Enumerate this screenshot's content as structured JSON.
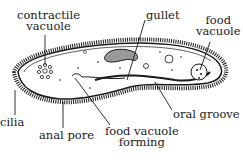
{
  "diagram": {
    "labels": {
      "contractile_vacuole_1": "contractile",
      "contractile_vacuole_2": "vacuole",
      "gullet": "gullet",
      "food_vacuole_1": "food",
      "food_vacuole_2": "vacuole",
      "oral_groove": "oral groove",
      "cilia": "cilia",
      "anal_pore": "anal pore",
      "food_vacuole_forming_1": "food vacuole",
      "food_vacuole_forming_2": "forming"
    },
    "colors": {
      "ink": "#1a1a1a",
      "background": "#ffffff"
    }
  }
}
